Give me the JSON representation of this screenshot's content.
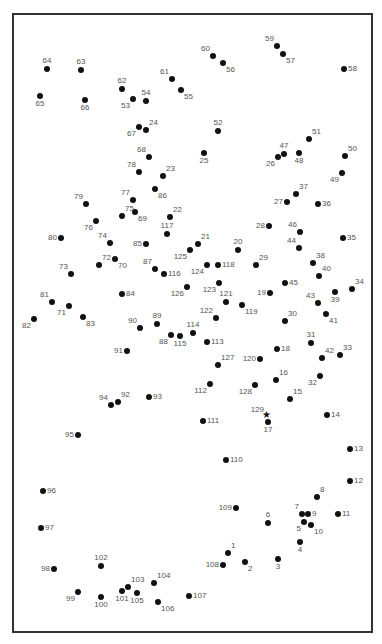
{
  "puzzle": {
    "type": "connect-the-dots",
    "total_points": 129,
    "end_marker": "star-icon",
    "colors": {
      "frame": "#333333",
      "dot": "#111111",
      "label": "#555555",
      "background": "#ffffff"
    },
    "points": [
      {
        "n": "1",
        "x": 228,
        "y": 553,
        "o": "tr"
      },
      {
        "n": "2",
        "x": 245,
        "y": 562,
        "o": "br"
      },
      {
        "n": "3",
        "x": 278,
        "y": 559,
        "o": "b"
      },
      {
        "n": "4",
        "x": 300,
        "y": 542,
        "o": "b"
      },
      {
        "n": "5",
        "x": 304,
        "y": 522,
        "o": "bl"
      },
      {
        "n": "6",
        "x": 268,
        "y": 523,
        "o": "t"
      },
      {
        "n": "7",
        "x": 302,
        "y": 514,
        "o": "tl"
      },
      {
        "n": "8",
        "x": 317,
        "y": 497,
        "o": "tr"
      },
      {
        "n": "9",
        "x": 308,
        "y": 514,
        "o": "r"
      },
      {
        "n": "10",
        "x": 311,
        "y": 525,
        "o": "br"
      },
      {
        "n": "11",
        "x": 338,
        "y": 514,
        "o": "r"
      },
      {
        "n": "12",
        "x": 350,
        "y": 481,
        "o": "r"
      },
      {
        "n": "13",
        "x": 350,
        "y": 449,
        "o": "r"
      },
      {
        "n": "14",
        "x": 327,
        "y": 415,
        "o": "r"
      },
      {
        "n": "15",
        "x": 290,
        "y": 399,
        "o": "tr"
      },
      {
        "n": "16",
        "x": 276,
        "y": 380,
        "o": "tr"
      },
      {
        "n": "17",
        "x": 268,
        "y": 422,
        "o": "b"
      },
      {
        "n": "18",
        "x": 277,
        "y": 349,
        "o": "r"
      },
      {
        "n": "19",
        "x": 270,
        "y": 293,
        "o": "l"
      },
      {
        "n": "20",
        "x": 238,
        "y": 250,
        "o": "t"
      },
      {
        "n": "21",
        "x": 198,
        "y": 244,
        "o": "tr"
      },
      {
        "n": "22",
        "x": 170,
        "y": 217,
        "o": "tr"
      },
      {
        "n": "23",
        "x": 163,
        "y": 176,
        "o": "tr"
      },
      {
        "n": "24",
        "x": 146,
        "y": 130,
        "o": "tr"
      },
      {
        "n": "25",
        "x": 204,
        "y": 153,
        "o": "b"
      },
      {
        "n": "26",
        "x": 278,
        "y": 157,
        "o": "bl"
      },
      {
        "n": "27",
        "x": 287,
        "y": 202,
        "o": "l"
      },
      {
        "n": "28",
        "x": 269,
        "y": 226,
        "o": "l"
      },
      {
        "n": "29",
        "x": 256,
        "y": 265,
        "o": "tr"
      },
      {
        "n": "30",
        "x": 285,
        "y": 321,
        "o": "tr"
      },
      {
        "n": "31",
        "x": 311,
        "y": 343,
        "o": "t"
      },
      {
        "n": "32",
        "x": 320,
        "y": 376,
        "o": "bl"
      },
      {
        "n": "33",
        "x": 340,
        "y": 355,
        "o": "tr"
      },
      {
        "n": "34",
        "x": 352,
        "y": 289,
        "o": "tr"
      },
      {
        "n": "35",
        "x": 343,
        "y": 238,
        "o": "r"
      },
      {
        "n": "36",
        "x": 318,
        "y": 204,
        "o": "r"
      },
      {
        "n": "37",
        "x": 296,
        "y": 194,
        "o": "tr"
      },
      {
        "n": "38",
        "x": 313,
        "y": 263,
        "o": "tr"
      },
      {
        "n": "39",
        "x": 335,
        "y": 292,
        "o": "b"
      },
      {
        "n": "40",
        "x": 319,
        "y": 276,
        "o": "tr"
      },
      {
        "n": "41",
        "x": 326,
        "y": 314,
        "o": "br"
      },
      {
        "n": "42",
        "x": 322,
        "y": 358,
        "o": "tr"
      },
      {
        "n": "43",
        "x": 318,
        "y": 303,
        "o": "tl"
      },
      {
        "n": "44",
        "x": 299,
        "y": 248,
        "o": "tl"
      },
      {
        "n": "45",
        "x": 285,
        "y": 283,
        "o": "r"
      },
      {
        "n": "46",
        "x": 300,
        "y": 232,
        "o": "tl"
      },
      {
        "n": "47",
        "x": 284,
        "y": 154,
        "o": "t"
      },
      {
        "n": "48",
        "x": 299,
        "y": 153,
        "o": "b"
      },
      {
        "n": "49",
        "x": 342,
        "y": 173,
        "o": "bl"
      },
      {
        "n": "50",
        "x": 345,
        "y": 156,
        "o": "tr"
      },
      {
        "n": "51",
        "x": 309,
        "y": 139,
        "o": "tr"
      },
      {
        "n": "52",
        "x": 218,
        "y": 131,
        "o": "t"
      },
      {
        "n": "53",
        "x": 133,
        "y": 99,
        "o": "bl"
      },
      {
        "n": "54",
        "x": 146,
        "y": 101,
        "o": "t"
      },
      {
        "n": "55",
        "x": 181,
        "y": 90,
        "o": "br"
      },
      {
        "n": "56",
        "x": 223,
        "y": 63,
        "o": "br"
      },
      {
        "n": "57",
        "x": 283,
        "y": 54,
        "o": "br"
      },
      {
        "n": "58",
        "x": 344,
        "y": 69,
        "o": "r"
      },
      {
        "n": "59",
        "x": 277,
        "y": 46,
        "o": "tl"
      },
      {
        "n": "60",
        "x": 213,
        "y": 56,
        "o": "tl"
      },
      {
        "n": "61",
        "x": 172,
        "y": 79,
        "o": "tl"
      },
      {
        "n": "62",
        "x": 122,
        "y": 89,
        "o": "t"
      },
      {
        "n": "63",
        "x": 81,
        "y": 70,
        "o": "t"
      },
      {
        "n": "64",
        "x": 47,
        "y": 69,
        "o": "t"
      },
      {
        "n": "65",
        "x": 40,
        "y": 96,
        "o": "b"
      },
      {
        "n": "66",
        "x": 85,
        "y": 100,
        "o": "b"
      },
      {
        "n": "67",
        "x": 139,
        "y": 127,
        "o": "bl"
      },
      {
        "n": "68",
        "x": 149,
        "y": 157,
        "o": "tl"
      },
      {
        "n": "69",
        "x": 135,
        "y": 212,
        "o": "br"
      },
      {
        "n": "70",
        "x": 115,
        "y": 259,
        "o": "br"
      },
      {
        "n": "71",
        "x": 69,
        "y": 306,
        "o": "bl"
      },
      {
        "n": "72",
        "x": 99,
        "y": 265,
        "o": "tr"
      },
      {
        "n": "73",
        "x": 71,
        "y": 274,
        "o": "tl"
      },
      {
        "n": "74",
        "x": 110,
        "y": 243,
        "o": "tl"
      },
      {
        "n": "75",
        "x": 122,
        "y": 216,
        "o": "tr"
      },
      {
        "n": "76",
        "x": 96,
        "y": 221,
        "o": "bl"
      },
      {
        "n": "77",
        "x": 133,
        "y": 200,
        "o": "tl"
      },
      {
        "n": "78",
        "x": 139,
        "y": 172,
        "o": "tl"
      },
      {
        "n": "79",
        "x": 86,
        "y": 204,
        "o": "tl"
      },
      {
        "n": "80",
        "x": 61,
        "y": 238,
        "o": "l"
      },
      {
        "n": "81",
        "x": 52,
        "y": 302,
        "o": "tl"
      },
      {
        "n": "82",
        "x": 34,
        "y": 319,
        "o": "bl"
      },
      {
        "n": "83",
        "x": 83,
        "y": 317,
        "o": "br"
      },
      {
        "n": "84",
        "x": 122,
        "y": 294,
        "o": "r"
      },
      {
        "n": "85",
        "x": 146,
        "y": 244,
        "o": "l"
      },
      {
        "n": "86",
        "x": 155,
        "y": 189,
        "o": "br"
      },
      {
        "n": "87",
        "x": 155,
        "y": 269,
        "o": "tl"
      },
      {
        "n": "88",
        "x": 171,
        "y": 335,
        "o": "bl"
      },
      {
        "n": "89",
        "x": 157,
        "y": 324,
        "o": "t"
      },
      {
        "n": "90",
        "x": 140,
        "y": 328,
        "o": "tl"
      },
      {
        "n": "91",
        "x": 127,
        "y": 351,
        "o": "l"
      },
      {
        "n": "92",
        "x": 118,
        "y": 402,
        "o": "tr"
      },
      {
        "n": "93",
        "x": 149,
        "y": 397,
        "o": "r"
      },
      {
        "n": "94",
        "x": 111,
        "y": 405,
        "o": "tl"
      },
      {
        "n": "95",
        "x": 78,
        "y": 435,
        "o": "l"
      },
      {
        "n": "96",
        "x": 43,
        "y": 491,
        "o": "r"
      },
      {
        "n": "97",
        "x": 41,
        "y": 528,
        "o": "r"
      },
      {
        "n": "98",
        "x": 54,
        "y": 569,
        "o": "l"
      },
      {
        "n": "99",
        "x": 78,
        "y": 592,
        "o": "bl"
      },
      {
        "n": "100",
        "x": 101,
        "y": 597,
        "o": "b"
      },
      {
        "n": "101",
        "x": 122,
        "y": 591,
        "o": "b"
      },
      {
        "n": "102",
        "x": 101,
        "y": 566,
        "o": "t"
      },
      {
        "n": "103",
        "x": 128,
        "y": 587,
        "o": "tr"
      },
      {
        "n": "104",
        "x": 154,
        "y": 583,
        "o": "tr"
      },
      {
        "n": "105",
        "x": 137,
        "y": 593,
        "o": "b"
      },
      {
        "n": "106",
        "x": 158,
        "y": 602,
        "o": "br"
      },
      {
        "n": "107",
        "x": 189,
        "y": 596,
        "o": "r"
      },
      {
        "n": "108",
        "x": 223,
        "y": 565,
        "o": "l"
      },
      {
        "n": "109",
        "x": 236,
        "y": 508,
        "o": "l"
      },
      {
        "n": "110",
        "x": 226,
        "y": 460,
        "o": "r"
      },
      {
        "n": "111",
        "x": 203,
        "y": 421,
        "o": "r"
      },
      {
        "n": "112",
        "x": 210,
        "y": 384,
        "o": "bl"
      },
      {
        "n": "113",
        "x": 207,
        "y": 342,
        "o": "r"
      },
      {
        "n": "114",
        "x": 193,
        "y": 333,
        "o": "t"
      },
      {
        "n": "115",
        "x": 180,
        "y": 336,
        "o": "b"
      },
      {
        "n": "116",
        "x": 164,
        "y": 274,
        "o": "r"
      },
      {
        "n": "117",
        "x": 167,
        "y": 234,
        "o": "t"
      },
      {
        "n": "118",
        "x": 218,
        "y": 265,
        "o": "r"
      },
      {
        "n": "119",
        "x": 242,
        "y": 305,
        "o": "br"
      },
      {
        "n": "120",
        "x": 260,
        "y": 359,
        "o": "l"
      },
      {
        "n": "121",
        "x": 226,
        "y": 302,
        "o": "t"
      },
      {
        "n": "122",
        "x": 216,
        "y": 318,
        "o": "tl"
      },
      {
        "n": "123",
        "x": 219,
        "y": 283,
        "o": "bl"
      },
      {
        "n": "124",
        "x": 207,
        "y": 265,
        "o": "bl"
      },
      {
        "n": "125",
        "x": 190,
        "y": 250,
        "o": "bl"
      },
      {
        "n": "126",
        "x": 187,
        "y": 287,
        "o": "bl"
      },
      {
        "n": "127",
        "x": 218,
        "y": 365,
        "o": "tr"
      },
      {
        "n": "128",
        "x": 255,
        "y": 385,
        "o": "bl"
      },
      {
        "n": "129",
        "x": 267,
        "y": 417,
        "o": "tl",
        "star": true
      }
    ]
  }
}
